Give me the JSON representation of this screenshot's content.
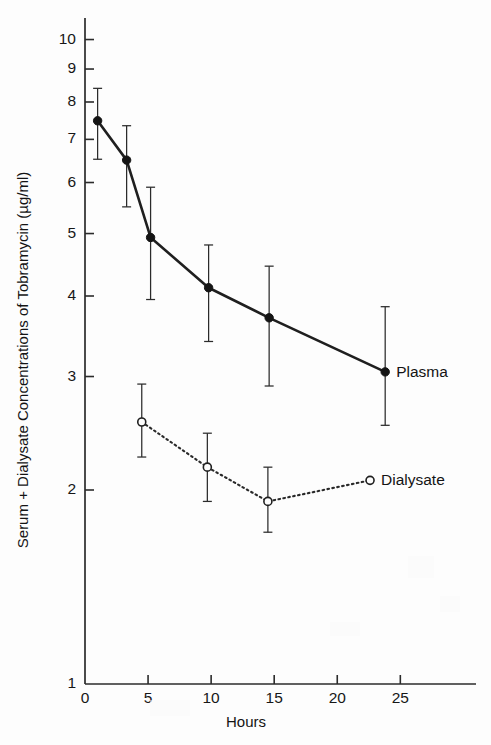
{
  "figure": {
    "background_color": "#fdfdfd",
    "ink_color": "#1a1a1a"
  },
  "chart_data": {
    "type": "line",
    "title": "",
    "subtitle": "",
    "xlabel": "Hours",
    "ylabel": "Serum + Dialysate Concentrations of Tobramycin (µg/ml)",
    "yscale": "log",
    "xscale": "linear",
    "xlim": [
      0,
      31
    ],
    "ylim": [
      1,
      10.8
    ],
    "grid": false,
    "legend_position": "inline-right-of-last-point",
    "xticks": [
      0,
      5,
      10,
      15,
      20,
      25
    ],
    "xticklabels": [
      "0",
      "5",
      "10",
      "15",
      "20",
      "25"
    ],
    "yticks": [
      1,
      2,
      3,
      4,
      5,
      6,
      7,
      8,
      9,
      10
    ],
    "yticklabels": [
      "1",
      "2",
      "3",
      "4",
      "5",
      "6",
      "7",
      "8",
      "9",
      "10"
    ],
    "series": [
      {
        "name": "Plasma",
        "marker": "filled-circle",
        "linestyle": "solid",
        "x": [
          1.0,
          3.3,
          5.2,
          9.8,
          14.6,
          23.8
        ],
        "values": [
          7.48,
          6.5,
          4.93,
          4.12,
          3.7,
          3.05
        ],
        "err_low": [
          6.52,
          5.5,
          3.95,
          3.4,
          2.9,
          2.52
        ],
        "err_high": [
          8.4,
          7.35,
          5.9,
          4.8,
          4.45,
          3.85
        ]
      },
      {
        "name": "Dialysate",
        "marker": "open-circle",
        "linestyle": "dotted",
        "x": [
          4.5,
          9.7,
          14.5,
          22.6
        ],
        "values": [
          2.55,
          2.17,
          1.92,
          2.07
        ],
        "err_low": [
          2.25,
          1.92,
          1.72,
          2.07
        ],
        "err_high": [
          2.92,
          2.45,
          2.17,
          2.07
        ]
      }
    ],
    "annotations": [
      {
        "text": "Plasma",
        "x": 23.8,
        "y": 3.05
      },
      {
        "text": "Dialysate",
        "x": 22.6,
        "y": 2.07
      }
    ]
  },
  "axis": {
    "x_title": "Hours",
    "y_title": "Serum + Dialysate Concentrations of Tobramycin (µg/ml)"
  },
  "legend": {
    "plasma_label": "Plasma",
    "dialysate_label": "Dialysate"
  },
  "ticks": {
    "y": [
      "10",
      "9",
      "8",
      "7",
      "6",
      "5",
      "4",
      "3",
      "2",
      "1"
    ],
    "x": [
      "0",
      "5",
      "10",
      "15",
      "20",
      "25"
    ]
  }
}
